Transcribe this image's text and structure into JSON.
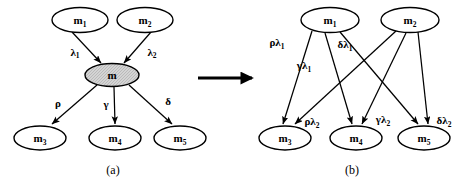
{
  "figure": {
    "caption_a": "(a)",
    "caption_b": "(b)",
    "transform_arrow_name": "transforms-into-arrow"
  },
  "panel_a": {
    "caption": "(a)",
    "nodes": [
      {
        "id": "m1",
        "base": "m",
        "sub": "1",
        "cx": 80,
        "cy": 20,
        "rx": 28,
        "ry": 12.5,
        "shaded": false
      },
      {
        "id": "m2",
        "base": "m",
        "sub": "2",
        "cx": 145,
        "cy": 20,
        "rx": 28,
        "ry": 12.5,
        "shaded": false
      },
      {
        "id": "m",
        "base": "m",
        "sub": "",
        "cx": 112,
        "cy": 75,
        "rx": 27,
        "ry": 11.5,
        "shaded": true
      },
      {
        "id": "m3",
        "base": "m",
        "sub": "3",
        "cx": 40,
        "cy": 138,
        "rx": 26,
        "ry": 12,
        "shaded": false
      },
      {
        "id": "m4",
        "base": "m",
        "sub": "4",
        "cx": 115,
        "cy": 138,
        "rx": 26,
        "ry": 12,
        "shaded": false
      },
      {
        "id": "m5",
        "base": "m",
        "sub": "5",
        "cx": 180,
        "cy": 138,
        "rx": 26,
        "ry": 12,
        "shaded": false
      }
    ],
    "edges": [
      {
        "from": "m1",
        "to": "m",
        "label_base": "λ",
        "label_sub": "1",
        "label_x": 75,
        "label_y": 52
      },
      {
        "from": "m2",
        "to": "m",
        "label_base": "λ",
        "label_sub": "2",
        "label_x": 152,
        "label_y": 52
      },
      {
        "from": "m",
        "to": "m3",
        "label_base": "ρ",
        "label_sub": "",
        "label_x": 58,
        "label_y": 103
      },
      {
        "from": "m",
        "to": "m4",
        "label_base": "γ",
        "label_sub": "",
        "label_x": 106,
        "label_y": 104
      },
      {
        "from": "m",
        "to": "m5",
        "label_base": "δ",
        "label_sub": "",
        "label_x": 168,
        "label_y": 101
      }
    ]
  },
  "panel_b": {
    "caption": "(b)",
    "nodes": [
      {
        "id": "m1",
        "base": "m",
        "sub": "1",
        "cx": 330,
        "cy": 20,
        "rx": 29,
        "ry": 12.5,
        "shaded": false
      },
      {
        "id": "m2",
        "base": "m",
        "sub": "2",
        "cx": 410,
        "cy": 20,
        "rx": 29,
        "ry": 12.5,
        "shaded": false
      },
      {
        "id": "m3",
        "base": "m",
        "sub": "3",
        "cx": 285,
        "cy": 138,
        "rx": 26,
        "ry": 12,
        "shaded": false
      },
      {
        "id": "m4",
        "base": "m",
        "sub": "4",
        "cx": 356,
        "cy": 138,
        "rx": 26,
        "ry": 12,
        "shaded": false
      },
      {
        "id": "m5",
        "base": "m",
        "sub": "5",
        "cx": 424,
        "cy": 138,
        "rx": 26,
        "ry": 12,
        "shaded": false
      }
    ],
    "edges": [
      {
        "from": "m1",
        "to": "m3",
        "label_base": "ρλ",
        "label_sub": "1",
        "label_x": 277,
        "label_y": 42
      },
      {
        "from": "m1",
        "to": "m4",
        "label_base": "γλ",
        "label_sub": "1",
        "label_x": 304,
        "label_y": 65
      },
      {
        "from": "m1",
        "to": "m5",
        "label_base": "δλ",
        "label_sub": "1",
        "label_x": 345,
        "label_y": 44
      },
      {
        "from": "m2",
        "to": "m3",
        "label_base": "ρλ",
        "label_sub": "2",
        "label_x": 312,
        "label_y": 121
      },
      {
        "from": "m2",
        "to": "m4",
        "label_base": "γλ",
        "label_sub": "2",
        "label_x": 383,
        "label_y": 119
      },
      {
        "from": "m2",
        "to": "m5",
        "label_base": "δλ",
        "label_sub": "2",
        "label_x": 442,
        "label_y": 120
      }
    ]
  },
  "colors": {
    "background": "#ffffff",
    "stroke": "#000000",
    "shaded_node_fill": "#cfcfcf"
  }
}
